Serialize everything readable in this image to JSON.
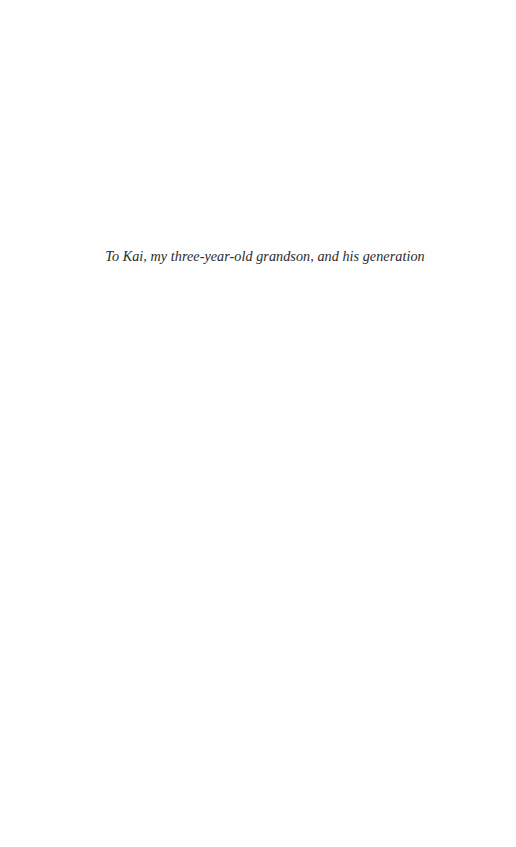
{
  "page": {
    "dedication": "To Kai, my three-year-old grandson, and his generation"
  }
}
